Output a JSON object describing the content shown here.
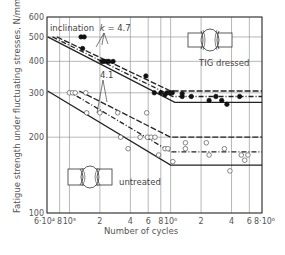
{
  "chart_data": {
    "type": "scatter",
    "title": "",
    "xlabel": "Number of cycles",
    "ylabel": "Fatigue strength under fluctuating stresses, N/mm²",
    "xscale": "log",
    "yscale": "log",
    "xlim": [
      60000,
      8000000
    ],
    "ylim": [
      100,
      600
    ],
    "grid": true,
    "legend": "none (inline annotations)",
    "x_ticks": [
      {
        "value": 60000,
        "label": "6·10⁴"
      },
      {
        "value": 80000,
        "label": "8"
      },
      {
        "value": 100000,
        "label": "10⁵"
      },
      {
        "value": 200000,
        "label": "2"
      },
      {
        "value": 400000,
        "label": "4"
      },
      {
        "value": 600000,
        "label": "6"
      },
      {
        "value": 800000,
        "label": "8"
      },
      {
        "value": 1000000,
        "label": "10⁶"
      },
      {
        "value": 2000000,
        "label": "2"
      },
      {
        "value": 4000000,
        "label": "4"
      },
      {
        "value": 6000000,
        "label": "6"
      },
      {
        "value": 8000000,
        "label": "8·10⁶"
      }
    ],
    "y_ticks": [
      {
        "value": 100,
        "label": "100"
      },
      {
        "value": 200,
        "label": "200"
      },
      {
        "value": 300,
        "label": "300"
      },
      {
        "value": 400,
        "label": "400"
      },
      {
        "value": 500,
        "label": "500"
      },
      {
        "value": 600,
        "label": "600"
      }
    ],
    "annotations": [
      {
        "text": "inclination  k = 4.7",
        "target": "TIG dressed curves"
      },
      {
        "text": "4.1",
        "target": "untreated curves"
      },
      {
        "text": "TIG dressed",
        "target": "filled markers / upper band"
      },
      {
        "text": "untreated",
        "target": "open markers / lower band"
      }
    ],
    "series": [
      {
        "name": "TIG dressed (test data)",
        "marker": "filled-circle",
        "points": [
          [
            130000,
            500
          ],
          [
            140000,
            500
          ],
          [
            135000,
            450
          ],
          [
            210000,
            400
          ],
          [
            220000,
            400
          ],
          [
            235000,
            400
          ],
          [
            245000,
            400
          ],
          [
            270000,
            400
          ],
          [
            570000,
            350
          ],
          [
            690000,
            300
          ],
          [
            800000,
            300
          ],
          [
            880000,
            295
          ],
          [
            920000,
            300
          ],
          [
            980000,
            300
          ],
          [
            1040000,
            300
          ],
          [
            1300000,
            298
          ],
          [
            1300000,
            290
          ],
          [
            1600000,
            290
          ],
          [
            2400000,
            280
          ],
          [
            2800000,
            290
          ],
          [
            3200000,
            280
          ],
          [
            3600000,
            270
          ],
          [
            4800000,
            290
          ]
        ]
      },
      {
        "name": "Untreated (test data)",
        "marker": "open-circle",
        "points": [
          [
            100000,
            300
          ],
          [
            107000,
            300
          ],
          [
            114000,
            300
          ],
          [
            145000,
            300
          ],
          [
            148000,
            250
          ],
          [
            200000,
            250
          ],
          [
            300000,
            250
          ],
          [
            580000,
            250
          ],
          [
            320000,
            200
          ],
          [
            380000,
            180
          ],
          [
            500000,
            200
          ],
          [
            590000,
            200
          ],
          [
            640000,
            200
          ],
          [
            700000,
            200
          ],
          [
            760000,
            170
          ],
          [
            880000,
            180
          ],
          [
            940000,
            180
          ],
          [
            1050000,
            160
          ],
          [
            1400000,
            190
          ],
          [
            1400000,
            180
          ],
          [
            2250000,
            190
          ],
          [
            2400000,
            170
          ],
          [
            3400000,
            180
          ],
          [
            3850000,
            147
          ],
          [
            5000000,
            170
          ],
          [
            5400000,
            162
          ],
          [
            5800000,
            170
          ]
        ]
      },
      {
        "name": "TIG dressed - upper band (dashed)",
        "style": "dashed",
        "slope_k": 4.7,
        "points": [
          [
            75000,
            500
          ],
          [
            1000000,
            305
          ],
          [
            8000000,
            305
          ]
        ]
      },
      {
        "name": "TIG dressed - mean (dash-dot)",
        "style": "dash-dot",
        "slope_k": 4.7,
        "points": [
          [
            68000,
            500
          ],
          [
            1050000,
            290
          ],
          [
            8000000,
            290
          ]
        ]
      },
      {
        "name": "TIG dressed - lower band (solid)",
        "style": "solid",
        "slope_k": 4.7,
        "points": [
          [
            61000,
            500
          ],
          [
            1100000,
            275
          ],
          [
            8000000,
            275
          ]
        ]
      },
      {
        "name": "Untreated - upper band (dashed)",
        "style": "dashed",
        "slope_k": 4.1,
        "points": [
          [
            125000,
            305
          ],
          [
            1000000,
            200
          ],
          [
            8000000,
            200
          ]
        ]
      },
      {
        "name": "Untreated - mean (dash-dot)",
        "style": "dash-dot",
        "slope_k": 4.1,
        "points": [
          [
            97000,
            305
          ],
          [
            1000000,
            175
          ],
          [
            8000000,
            175
          ]
        ]
      },
      {
        "name": "Untreated - lower band (solid)",
        "style": "solid",
        "slope_k": 4.1,
        "points": [
          [
            61000,
            305
          ],
          [
            1000000,
            155
          ],
          [
            8000000,
            155
          ]
        ]
      }
    ]
  },
  "labels": {
    "ylabel": "Fatigue strength under fluctuating stresses, N/mm²",
    "xlabel": "Number of cycles",
    "inclination": "inclination",
    "k_symbol": "k",
    "k_tig": "= 4.7",
    "k_untreated": "4.1",
    "tig": "TIG dressed",
    "untreated": "untreated"
  }
}
